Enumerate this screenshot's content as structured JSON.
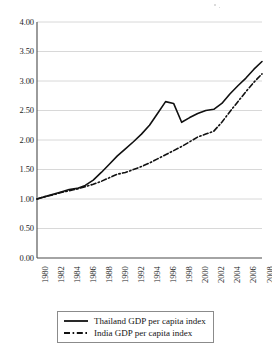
{
  "chart_data": {
    "type": "line",
    "title": "",
    "subtitle": "",
    "xlabel": "",
    "ylabel": "",
    "xlim": [
      1980,
      2008
    ],
    "ylim": [
      0.0,
      4.0
    ],
    "grid": true,
    "legend_position": "below-axis-center",
    "x": [
      1980,
      1981,
      1982,
      1983,
      1984,
      1985,
      1986,
      1987,
      1988,
      1989,
      1990,
      1991,
      1992,
      1993,
      1994,
      1995,
      1996,
      1997,
      1998,
      1999,
      2000,
      2001,
      2002,
      2003,
      2004,
      2005,
      2006,
      2007,
      2008
    ],
    "xtick_labels": [
      "1980",
      "1982",
      "1984",
      "1986",
      "1988",
      "1990",
      "1992",
      "1994",
      "1996",
      "1998",
      "2000",
      "2002",
      "2004",
      "2006",
      "2008"
    ],
    "xtick_values": [
      1980,
      1982,
      1984,
      1986,
      1988,
      1990,
      1992,
      1994,
      1996,
      1998,
      2000,
      2002,
      2004,
      2006,
      2008
    ],
    "ytick_labels": [
      "4.00",
      "3.50",
      "3.00",
      "2.50",
      "2.00",
      "1.50",
      "1.00",
      "0.50",
      "0.00"
    ],
    "ytick_values": [
      4.0,
      3.5,
      3.0,
      2.5,
      2.0,
      1.5,
      1.0,
      0.5,
      0.0
    ],
    "series": [
      {
        "name": "Thailand GDP per capita index",
        "style": "solid",
        "color": "#111111",
        "values": [
          1.0,
          1.04,
          1.08,
          1.12,
          1.16,
          1.18,
          1.23,
          1.32,
          1.45,
          1.59,
          1.73,
          1.85,
          1.97,
          2.1,
          2.25,
          2.45,
          2.65,
          2.62,
          2.3,
          2.38,
          2.45,
          2.5,
          2.52,
          2.62,
          2.78,
          2.92,
          3.05,
          3.2,
          3.33
        ]
      },
      {
        "name": "India GDP per capita index",
        "style": "dash-dot",
        "color": "#111111",
        "values": [
          1.0,
          1.04,
          1.07,
          1.11,
          1.14,
          1.17,
          1.21,
          1.25,
          1.3,
          1.36,
          1.42,
          1.45,
          1.5,
          1.55,
          1.61,
          1.68,
          1.75,
          1.82,
          1.89,
          1.97,
          2.05,
          2.1,
          2.15,
          2.3,
          2.48,
          2.65,
          2.82,
          2.98,
          3.12
        ]
      }
    ]
  },
  "legend": {
    "items": [
      {
        "label": "Thailand GDP per capita index",
        "style": "solid"
      },
      {
        "label": "India GDP per capita index",
        "style": "dash-dot"
      }
    ]
  },
  "colors": {
    "line": "#111111",
    "grid": "#d4d4d4",
    "axis": "#4a4a4a",
    "text": "#1a1a1a",
    "background": "#ffffff"
  }
}
